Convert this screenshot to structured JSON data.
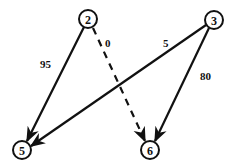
{
  "graph": {
    "nodes": [
      {
        "id": "2",
        "label": "2",
        "x": 88,
        "y": 19
      },
      {
        "id": "3",
        "label": "3",
        "x": 214,
        "y": 20
      },
      {
        "id": "5",
        "label": "5",
        "x": 22,
        "y": 150
      },
      {
        "id": "6",
        "label": "6",
        "x": 150,
        "y": 150
      }
    ],
    "edges": [
      {
        "from": "2",
        "to": "5",
        "weight": "95",
        "style": "solid"
      },
      {
        "from": "2",
        "to": "6",
        "weight": "0",
        "style": "dashed"
      },
      {
        "from": "3",
        "to": "5",
        "weight": "5",
        "style": "solid"
      },
      {
        "from": "3",
        "to": "6",
        "weight": "80",
        "style": "solid"
      }
    ]
  }
}
